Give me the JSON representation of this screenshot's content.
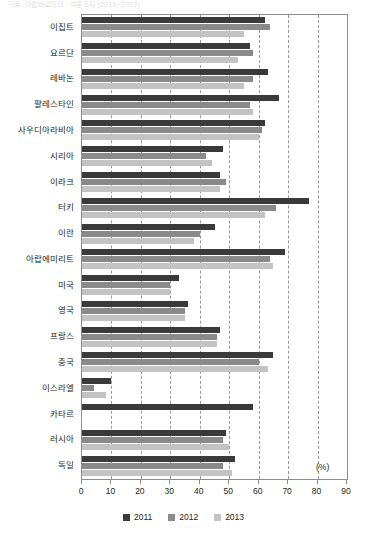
{
  "header": {
    "faint_top_text": "자료: 아랍바로미터 · 여론조사 (2011~2013)"
  },
  "axis": {
    "unit_label": "(%)",
    "x_ticks": [
      0,
      10,
      20,
      30,
      40,
      50,
      60,
      70,
      80,
      90
    ],
    "x_min": 0,
    "x_max": 90
  },
  "legend": {
    "position": "bottom-center",
    "items": [
      {
        "label": "2011",
        "color": "#3a3a3a"
      },
      {
        "label": "2012",
        "color": "#8a8a8a"
      },
      {
        "label": "2013",
        "color": "#c3c3c3"
      }
    ]
  },
  "chart_data": {
    "type": "bar",
    "orientation": "horizontal",
    "title": "",
    "xlabel": "(%)",
    "ylabel": "",
    "xlim": [
      0,
      90
    ],
    "grid": true,
    "grid_style": "dashed-vertical",
    "categories": [
      "이집트",
      "요르단",
      "레바논",
      "팔레스타인",
      "사우디아라비아",
      "시리아",
      "이라크",
      "터키",
      "이란",
      "아랍에미리트",
      "미국",
      "영국",
      "프랑스",
      "중국",
      "이스라엘",
      "카타르",
      "러시아",
      "독일"
    ],
    "series": [
      {
        "name": "2011",
        "color": "#3a3a3a",
        "values": [
          62,
          57,
          63,
          67,
          62,
          48,
          47,
          77,
          45,
          69,
          33,
          36,
          47,
          65,
          10,
          58,
          49,
          52
        ]
      },
      {
        "name": "2012",
        "color": "#8a8a8a",
        "values": [
          64,
          58,
          58,
          57,
          61,
          42,
          49,
          66,
          40,
          64,
          30,
          35,
          46,
          60,
          4,
          null,
          48,
          48
        ]
      },
      {
        "name": "2013",
        "color": "#c3c3c3",
        "values": [
          55,
          53,
          55,
          58,
          60,
          44,
          47,
          62,
          38,
          65,
          30,
          35,
          46,
          63,
          8,
          null,
          50,
          51
        ]
      }
    ]
  }
}
